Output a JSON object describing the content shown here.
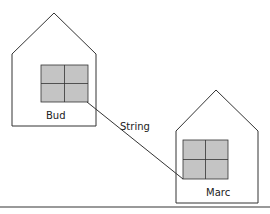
{
  "diagram": {
    "houses": [
      {
        "label": "Bud"
      },
      {
        "label": "Marc"
      }
    ],
    "connector_label": "String",
    "colors": {
      "window": "#c4c4c4",
      "stroke": "#333333",
      "rule": "#999999"
    }
  }
}
